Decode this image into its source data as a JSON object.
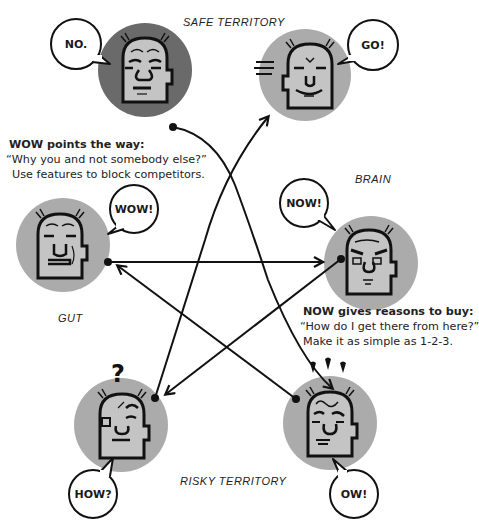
{
  "labels": {
    "safe_territory": "SAFE TERRITORY",
    "brain": "BRAIN",
    "gut": "GUT",
    "risky_territory": "RISKY TERRITORY"
  },
  "faces": [
    {
      "id": "no",
      "bubble": "NO.",
      "mood": "grumpy",
      "fill": "#6a6a6a"
    },
    {
      "id": "go",
      "bubble": "GO!",
      "mood": "smiling",
      "fill": "#ababab"
    },
    {
      "id": "wow",
      "bubble": "WOW!",
      "mood": "smirking",
      "fill": "#ababab"
    },
    {
      "id": "now",
      "bubble": "NOW!",
      "mood": "stern",
      "fill": "#ababab"
    },
    {
      "id": "how",
      "bubble": "HOW?",
      "mood": "puzzled",
      "fill": "#ababab",
      "extra": "?"
    },
    {
      "id": "ow",
      "bubble": "OW!",
      "mood": "worried",
      "fill": "#ababab"
    }
  ],
  "notes": {
    "wow": {
      "heading": "WOW points the way:",
      "line1": "“Why you and not somebody else?”",
      "line2": "Use features to block competitors."
    },
    "now": {
      "heading": "NOW gives reasons to buy:",
      "line1": "“How do I get there from here?”",
      "line2": "Make it as simple as 1-2-3."
    }
  },
  "arrows": [
    {
      "from": "no",
      "to": "ow"
    },
    {
      "from": "how",
      "to": "go"
    },
    {
      "from": "wow",
      "to": "now"
    },
    {
      "from": "now",
      "to": "how"
    },
    {
      "from": "ow",
      "to": "wow"
    }
  ],
  "colors": {
    "ink": "#111111",
    "face_skin": "#c4c4c4",
    "circle_light": "#ababab",
    "circle_dark": "#6a6a6a"
  }
}
